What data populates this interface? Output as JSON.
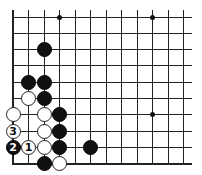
{
  "board": {
    "origin_x": 13,
    "origin_y": 17,
    "col_spacing": 15.5,
    "row_spacing": 16.3,
    "cols": 12,
    "rows": 10,
    "right_extent": 192,
    "edges": {
      "left": true,
      "bottom": true,
      "top": false,
      "right": false
    },
    "colors": {
      "black": "#111111",
      "white": "#ffffff",
      "line": "#222222"
    }
  },
  "star_points": [
    {
      "col": 3,
      "row": 0
    },
    {
      "col": 9,
      "row": 0
    },
    {
      "col": 9,
      "row": 6
    }
  ],
  "stones": [
    {
      "color": "black",
      "col": 2,
      "row": 2,
      "label": ""
    },
    {
      "color": "black",
      "col": 1,
      "row": 4,
      "label": ""
    },
    {
      "color": "black",
      "col": 2,
      "row": 4,
      "label": ""
    },
    {
      "color": "white",
      "col": 1,
      "row": 5,
      "label": ""
    },
    {
      "color": "black",
      "col": 2,
      "row": 5,
      "label": ""
    },
    {
      "color": "white",
      "col": 0,
      "row": 6,
      "label": ""
    },
    {
      "color": "white",
      "col": 2,
      "row": 6,
      "label": ""
    },
    {
      "color": "black",
      "col": 3,
      "row": 6,
      "label": ""
    },
    {
      "color": "white",
      "col": 0,
      "row": 7,
      "label": "3"
    },
    {
      "color": "white",
      "col": 2,
      "row": 7,
      "label": ""
    },
    {
      "color": "black",
      "col": 3,
      "row": 7,
      "label": ""
    },
    {
      "color": "black",
      "col": 0,
      "row": 8,
      "label": "2"
    },
    {
      "color": "white",
      "col": 1,
      "row": 8,
      "label": "1"
    },
    {
      "color": "white",
      "col": 2,
      "row": 8,
      "label": ""
    },
    {
      "color": "black",
      "col": 3,
      "row": 8,
      "label": ""
    },
    {
      "color": "black",
      "col": 5,
      "row": 8,
      "label": ""
    },
    {
      "color": "black",
      "col": 2,
      "row": 9,
      "label": ""
    },
    {
      "color": "white",
      "col": 3,
      "row": 9,
      "label": ""
    }
  ]
}
